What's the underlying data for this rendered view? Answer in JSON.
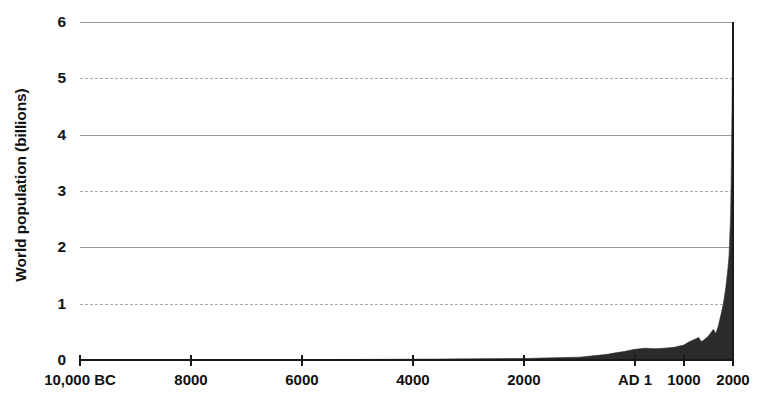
{
  "chart_data": {
    "type": "area",
    "title": "",
    "xlabel": "",
    "ylabel": "World population (billions)",
    "ylim": [
      0,
      6
    ],
    "grid": true,
    "legend": false,
    "y_ticks": [
      {
        "value": 6,
        "label": "6",
        "gridline": "solid"
      },
      {
        "value": 5,
        "label": "5",
        "gridline": "dashed"
      },
      {
        "value": 4,
        "label": "4",
        "gridline": "solid"
      },
      {
        "value": 3,
        "label": "3",
        "gridline": "dashed"
      },
      {
        "value": 2,
        "label": "2",
        "gridline": "solid"
      },
      {
        "value": 1,
        "label": "1",
        "gridline": "dashed"
      },
      {
        "value": 0,
        "label": "0",
        "gridline": "none"
      }
    ],
    "x_ticks": [
      {
        "year": -10000,
        "label": "10,000 BC"
      },
      {
        "year": -8000,
        "label": "8000"
      },
      {
        "year": -6000,
        "label": "6000"
      },
      {
        "year": -4000,
        "label": "4000"
      },
      {
        "year": -2000,
        "label": "2000"
      },
      {
        "year": 1,
        "label": "AD 1"
      },
      {
        "year": 1000,
        "label": "1000"
      },
      {
        "year": 2000,
        "label": "2000"
      }
    ],
    "series": [
      {
        "name": "World population",
        "color": "#2b2b2b",
        "units": "billions",
        "points": [
          {
            "year": -10000,
            "value": 0.004
          },
          {
            "year": -9000,
            "value": 0.004
          },
          {
            "year": -8000,
            "value": 0.005
          },
          {
            "year": -7000,
            "value": 0.006
          },
          {
            "year": -6000,
            "value": 0.007
          },
          {
            "year": -5000,
            "value": 0.01
          },
          {
            "year": -4000,
            "value": 0.014
          },
          {
            "year": -3000,
            "value": 0.02
          },
          {
            "year": -2000,
            "value": 0.027
          },
          {
            "year": -1500,
            "value": 0.038
          },
          {
            "year": -1000,
            "value": 0.05
          },
          {
            "year": -500,
            "value": 0.1
          },
          {
            "year": -400,
            "value": 0.12
          },
          {
            "year": -200,
            "value": 0.15
          },
          {
            "year": 1,
            "value": 0.19
          },
          {
            "year": 200,
            "value": 0.21
          },
          {
            "year": 400,
            "value": 0.2
          },
          {
            "year": 600,
            "value": 0.21
          },
          {
            "year": 800,
            "value": 0.225
          },
          {
            "year": 1000,
            "value": 0.265
          },
          {
            "year": 1100,
            "value": 0.32
          },
          {
            "year": 1200,
            "value": 0.36
          },
          {
            "year": 1300,
            "value": 0.4
          },
          {
            "year": 1350,
            "value": 0.33
          },
          {
            "year": 1400,
            "value": 0.35
          },
          {
            "year": 1500,
            "value": 0.425
          },
          {
            "year": 1600,
            "value": 0.545
          },
          {
            "year": 1650,
            "value": 0.47
          },
          {
            "year": 1700,
            "value": 0.6
          },
          {
            "year": 1750,
            "value": 0.79
          },
          {
            "year": 1800,
            "value": 0.98
          },
          {
            "year": 1850,
            "value": 1.26
          },
          {
            "year": 1900,
            "value": 1.65
          },
          {
            "year": 1920,
            "value": 1.86
          },
          {
            "year": 1940,
            "value": 2.3
          },
          {
            "year": 1950,
            "value": 2.52
          },
          {
            "year": 1960,
            "value": 3.02
          },
          {
            "year": 1970,
            "value": 3.7
          },
          {
            "year": 1980,
            "value": 4.44
          },
          {
            "year": 1990,
            "value": 5.32
          },
          {
            "year": 1999,
            "value": 6.0
          },
          {
            "year": 2000,
            "value": 6.0
          }
        ]
      }
    ],
    "annotations": []
  }
}
